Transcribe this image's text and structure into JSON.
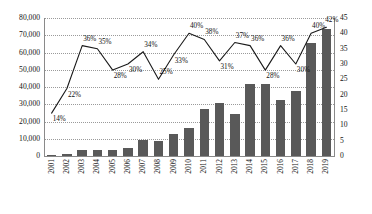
{
  "chart_data": {
    "type": "bar",
    "title": "",
    "subtitle": "",
    "xlabel": "",
    "ylabel": "",
    "grid": true,
    "legend": "none",
    "categories": [
      "2001",
      "2002",
      "2003",
      "2004",
      "2005",
      "2006",
      "2007",
      "2008",
      "2009",
      "2010",
      "2011",
      "2012",
      "2013",
      "2014",
      "2015",
      "2016",
      "2017",
      "2018",
      "2019"
    ],
    "series": [
      {
        "name": "Count",
        "type": "bar",
        "axis": "left",
        "color": "#595959",
        "values": [
          500,
          1200,
          3200,
          3700,
          3400,
          4500,
          9200,
          8500,
          12500,
          16500,
          27500,
          30500,
          24500,
          41500,
          42000,
          32500,
          37500,
          65500,
          73500
        ]
      },
      {
        "name": "Percentage",
        "type": "line",
        "axis": "right",
        "color": "#1a1a1a",
        "values": [
          14,
          22,
          36,
          35,
          28,
          30,
          34,
          25,
          33,
          40,
          38,
          31,
          37,
          36,
          28,
          36,
          30,
          40,
          42
        ],
        "data_labels": [
          "14%",
          "22%",
          "36%",
          "35%",
          "28%",
          "30%",
          "34%",
          "25%",
          "33%",
          "40%",
          "38%",
          "31%",
          "37%",
          "36%",
          "28%",
          "36%",
          "30%",
          "40%",
          "42%"
        ]
      }
    ],
    "left_axis": {
      "min": 0,
      "max": 80000,
      "step": 10000,
      "ticks": [
        "0",
        "10,000",
        "20,000",
        "30,000",
        "40,000",
        "50,000",
        "60,000",
        "70,000",
        "80,000"
      ]
    },
    "right_axis": {
      "min": 0,
      "max": 45,
      "step": 5,
      "ticks": [
        "0",
        "5",
        "10",
        "15",
        "20",
        "25",
        "30",
        "35",
        "40",
        "45"
      ]
    }
  }
}
